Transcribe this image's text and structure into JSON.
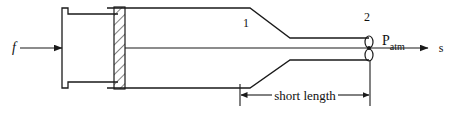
{
  "figure": {
    "background_color": "#ffffff",
    "line_color": "#1a1a1a",
    "labels": {
      "force": "f",
      "station_1": "1",
      "station_2": "2",
      "pressure_symbol": "P",
      "pressure_subscript": "atm",
      "coordinate_axis": "s",
      "dimension": "short length"
    }
  },
  "geometry": {
    "piston": {
      "face_x": 62,
      "flange_right_x": 118,
      "top_y": 14,
      "bottom_y": 82,
      "notch_depth": 6
    },
    "wall": {
      "x": 114,
      "width": 11,
      "top_y": 7,
      "bottom_y": 89,
      "hatch": "diagonal"
    },
    "duct": {
      "inlet_top_y": 8,
      "inlet_bottom_y": 88,
      "throat_top_y": 38,
      "throat_bottom_y": 60,
      "taper_start_x": 250,
      "taper_end_x": 290,
      "exit_x": 369,
      "centerline_y": 48
    },
    "dimension_line": {
      "y": 95,
      "left_x": 240,
      "right_x": 370
    },
    "exit_ellipse": {
      "cx": 369,
      "cy_top": 42,
      "cy_bottom": 54,
      "rx": 4,
      "ry": 6
    }
  }
}
